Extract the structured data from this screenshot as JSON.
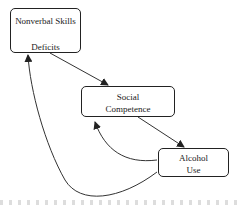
{
  "nodes": [
    {
      "id": "nonverbal",
      "lines": [
        "Nonverbal Skills",
        "Deficits"
      ]
    },
    {
      "id": "social",
      "lines": [
        "Social",
        "Competence"
      ]
    },
    {
      "id": "alcohol",
      "lines": [
        "Alcohol",
        "Use"
      ]
    }
  ],
  "edges": [
    {
      "from": "nonverbal",
      "to": "social"
    },
    {
      "from": "social",
      "to": "alcohol"
    },
    {
      "from": "alcohol",
      "to": "social"
    },
    {
      "from": "alcohol",
      "to": "nonverbal"
    }
  ]
}
